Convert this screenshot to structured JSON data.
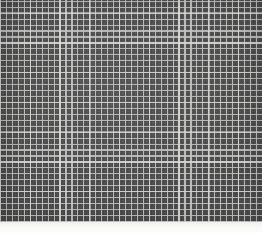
{
  "scene": {
    "kind": "grid-pattern-texture",
    "description": "Dense regular lattice of light gray lines over a dark charcoal field",
    "width_px": 262,
    "height_px": 233
  },
  "grid": {
    "name": "lattice-grid",
    "columns": 44,
    "rows": 37,
    "cell_pitch_px": 5.95,
    "line_width_px": 1.15,
    "major_line_every": 5,
    "base_color": "#4b4b4b",
    "line_color": "#c4c4c2",
    "major_line_color": "#e2e2df",
    "origin_x_px": 0,
    "origin_y_px": 0,
    "region_height_px": 222
  },
  "bottom_strip": {
    "name": "bottom-light-band",
    "top_px": 222,
    "height_px": 11,
    "color_top": "#efefec",
    "color_bottom": "#fdfdfc"
  },
  "palette": {
    "background": "#fbfbfa",
    "field_dark": "#4b4b4b",
    "field_dark_shadow": "#3f3f3f",
    "grid_line": "#c4c4c2",
    "grid_line_bright": "#e2e2df",
    "strip_light": "#f9f9f7"
  }
}
